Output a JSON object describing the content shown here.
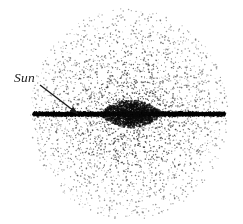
{
  "figure": {
    "name": "edge-on-galaxy-diagram",
    "width": 243,
    "height": 224,
    "background_color": "#ffffff"
  },
  "annotations": {
    "sun_label": "Sun",
    "sun_label_style": "italic-serif",
    "sun_label_color": "#1a1a1a",
    "sun_label_x": 14,
    "sun_label_y": 82,
    "pointer": {
      "name": "sun-pointer-arrow",
      "from_x": 40,
      "from_y": 85,
      "to_x": 78,
      "to_y": 114,
      "color": "#1a1a1a",
      "line_width": 1.4,
      "arrowhead_length": 8,
      "arrowhead_width": 4
    }
  },
  "chart_data": {
    "type": "scatter",
    "title": "",
    "subtitle": "",
    "xlabel": "",
    "ylabel": "",
    "grid": false,
    "legend": null,
    "components": [
      {
        "name": "halo",
        "shape": "circle",
        "center_x": 129,
        "center_y": 114,
        "radius_x": 99,
        "radius_y": 106,
        "dot_count": 5200,
        "dot_color": "#2b2b2b",
        "dot_min_size": 0.7,
        "dot_max_size": 1.7,
        "density_profile": "radial-falloff-with-disk-concentration"
      },
      {
        "name": "disk",
        "shape": "thin-band",
        "center_x": 129,
        "center_y": 114,
        "half_length": 96,
        "half_thickness": 3.2,
        "dot_count": 4200,
        "dot_color": "#000000",
        "dot_min_size": 0.8,
        "dot_max_size": 1.9
      },
      {
        "name": "bulge",
        "shape": "lens",
        "center_x": 131,
        "center_y": 114,
        "radius_x": 32,
        "radius_y": 14,
        "dot_count": 3000,
        "dot_color": "#0a0a0a",
        "dot_min_size": 0.9,
        "dot_max_size": 2.0
      },
      {
        "name": "sun-position",
        "shape": "point",
        "x": 78,
        "y": 114
      }
    ],
    "axis_ranges": {
      "x": [
        0,
        243
      ],
      "y": [
        0,
        224
      ]
    }
  }
}
